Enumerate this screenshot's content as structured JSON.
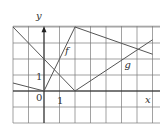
{
  "figure": {
    "grid": {
      "x_min": -2,
      "x_max": 7,
      "y_min": -2,
      "y_max": 5,
      "origin_px": [
        44,
        91
      ],
      "unit_x_px": 15.5,
      "unit_y_px": 16,
      "grid_color": "#7a7a7a",
      "line_color": "#555555"
    },
    "axes": {
      "x_label": "x",
      "y_label": "y",
      "origin_label": "0",
      "x_tick_label": "1",
      "y_tick_label": "1"
    },
    "curves": [
      {
        "name": "f",
        "label": "f",
        "points": [
          [
            -2,
            0.5
          ],
          [
            0,
            0
          ],
          [
            2,
            4
          ],
          [
            7,
            2.3
          ]
        ],
        "label_at": [
          1.35,
          2.3
        ]
      },
      {
        "name": "g",
        "label": "g",
        "points": [
          [
            -2,
            4
          ],
          [
            2,
            0
          ],
          [
            7,
            3.2
          ]
        ],
        "label_at": [
          5.2,
          1.45
        ]
      }
    ]
  }
}
